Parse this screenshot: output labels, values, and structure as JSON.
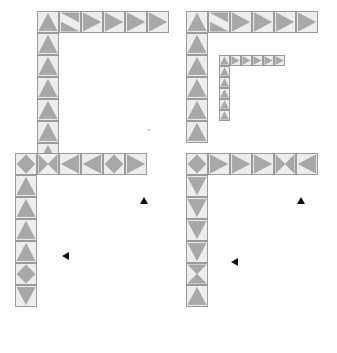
{
  "meta": {
    "canvas": {
      "width": 337,
      "height": 353
    },
    "colors": {
      "tile_fill": "#eceded",
      "triangle_fill": "#a8a8a8",
      "triangle_stroke": "#7d7d7d",
      "tile_stroke": "#9b9b9b",
      "marker": "#111111",
      "background": "#ffffff"
    },
    "cell_size": 22
  },
  "panels": [
    {
      "id": "panel-top-left",
      "name": "top-left-figure",
      "origin": {
        "x": 37,
        "y": 11
      },
      "cell": 22,
      "arm_v_rows": 7,
      "arm_h_cols": 6,
      "label": "A",
      "markers": [],
      "tiles": [
        {
          "col": 0,
          "row": 0,
          "shapes": [
            "up",
            "up-half-low"
          ]
        },
        {
          "col": 1,
          "row": 0,
          "shapes": [
            "right-down-diag"
          ]
        },
        {
          "col": 2,
          "row": 0,
          "shapes": [
            "right"
          ]
        },
        {
          "col": 3,
          "row": 0,
          "shapes": [
            "right"
          ]
        },
        {
          "col": 4,
          "row": 0,
          "shapes": [
            "right"
          ]
        },
        {
          "col": 5,
          "row": 0,
          "shapes": [
            "right"
          ]
        },
        {
          "col": 0,
          "row": 1,
          "shapes": [
            "up"
          ]
        },
        {
          "col": 0,
          "row": 2,
          "shapes": [
            "up"
          ]
        },
        {
          "col": 0,
          "row": 3,
          "shapes": [
            "up"
          ]
        },
        {
          "col": 0,
          "row": 4,
          "shapes": [
            "up"
          ]
        },
        {
          "col": 0,
          "row": 5,
          "shapes": [
            "up"
          ]
        },
        {
          "col": 0,
          "row": 6,
          "shapes": [
            "up"
          ]
        }
      ]
    },
    {
      "id": "panel-top-right",
      "name": "top-right-figure",
      "origin": {
        "x": 186,
        "y": 11
      },
      "cell": 22,
      "arm_v_rows": 6,
      "arm_h_cols": 6,
      "label": "B",
      "nested": {
        "name": "nested-half-scale-figure",
        "origin": {
          "x": 219,
          "y": 55
        },
        "cell": 11,
        "arm_v_rows": 6,
        "arm_h_cols": 6
      },
      "markers": [],
      "tiles": [
        {
          "col": 0,
          "row": 0,
          "shapes": [
            "up"
          ]
        },
        {
          "col": 1,
          "row": 0,
          "shapes": [
            "right-down-diag"
          ]
        },
        {
          "col": 2,
          "row": 0,
          "shapes": [
            "right"
          ]
        },
        {
          "col": 3,
          "row": 0,
          "shapes": [
            "right"
          ]
        },
        {
          "col": 4,
          "row": 0,
          "shapes": [
            "right"
          ]
        },
        {
          "col": 5,
          "row": 0,
          "shapes": [
            "right"
          ]
        },
        {
          "col": 0,
          "row": 1,
          "shapes": [
            "up"
          ]
        },
        {
          "col": 0,
          "row": 2,
          "shapes": [
            "up"
          ]
        },
        {
          "col": 0,
          "row": 3,
          "shapes": [
            "up"
          ]
        },
        {
          "col": 0,
          "row": 4,
          "shapes": [
            "up"
          ]
        },
        {
          "col": 0,
          "row": 5,
          "shapes": [
            "up"
          ]
        }
      ]
    },
    {
      "id": "panel-bottom-left",
      "name": "bottom-left-figure",
      "origin": {
        "x": 15,
        "y": 153
      },
      "cell": 22,
      "arm_v_rows": 7,
      "arm_h_cols": 6,
      "label": "C",
      "markers": [
        {
          "name": "up-marker",
          "direction": "up",
          "x": 140,
          "y": 197
        },
        {
          "name": "left-marker",
          "direction": "left",
          "x": 62,
          "y": 252
        }
      ],
      "tiles": [
        {
          "col": 0,
          "row": 0,
          "shapes": [
            "diamond"
          ]
        },
        {
          "col": 1,
          "row": 0,
          "shapes": [
            "hourglass-h"
          ]
        },
        {
          "col": 2,
          "row": 0,
          "shapes": [
            "left"
          ]
        },
        {
          "col": 3,
          "row": 0,
          "shapes": [
            "left"
          ]
        },
        {
          "col": 4,
          "row": 0,
          "shapes": [
            "diamond"
          ]
        },
        {
          "col": 5,
          "row": 0,
          "shapes": [
            "right"
          ]
        },
        {
          "col": 0,
          "row": 1,
          "shapes": [
            "up"
          ]
        },
        {
          "col": 0,
          "row": 2,
          "shapes": [
            "up"
          ]
        },
        {
          "col": 0,
          "row": 3,
          "shapes": [
            "up"
          ]
        },
        {
          "col": 0,
          "row": 4,
          "shapes": [
            "up"
          ]
        },
        {
          "col": 0,
          "row": 5,
          "shapes": [
            "diamond"
          ]
        },
        {
          "col": 0,
          "row": 6,
          "shapes": [
            "down"
          ]
        }
      ]
    },
    {
      "id": "panel-bottom-right",
      "name": "bottom-right-figure",
      "origin": {
        "x": 186,
        "y": 153
      },
      "cell": 22,
      "arm_v_rows": 7,
      "arm_h_cols": 6,
      "label": "D",
      "markers": [
        {
          "name": "up-marker",
          "direction": "up",
          "x": 297,
          "y": 197
        },
        {
          "name": "left-marker",
          "direction": "left",
          "x": 231,
          "y": 258
        }
      ],
      "tiles": [
        {
          "col": 0,
          "row": 0,
          "shapes": [
            "diamond"
          ]
        },
        {
          "col": 1,
          "row": 0,
          "shapes": [
            "right"
          ]
        },
        {
          "col": 2,
          "row": 0,
          "shapes": [
            "right"
          ]
        },
        {
          "col": 3,
          "row": 0,
          "shapes": [
            "right"
          ]
        },
        {
          "col": 4,
          "row": 0,
          "shapes": [
            "hourglass-h"
          ]
        },
        {
          "col": 5,
          "row": 0,
          "shapes": [
            "left"
          ]
        },
        {
          "col": 0,
          "row": 1,
          "shapes": [
            "down"
          ]
        },
        {
          "col": 0,
          "row": 2,
          "shapes": [
            "down"
          ]
        },
        {
          "col": 0,
          "row": 3,
          "shapes": [
            "down"
          ]
        },
        {
          "col": 0,
          "row": 4,
          "shapes": [
            "down"
          ]
        },
        {
          "col": 0,
          "row": 5,
          "shapes": [
            "hourglass-v"
          ]
        },
        {
          "col": 0,
          "row": 6,
          "shapes": [
            "up"
          ]
        }
      ]
    }
  ],
  "speck": {
    "name": "stray-pixel",
    "x": 148,
    "y": 129
  }
}
